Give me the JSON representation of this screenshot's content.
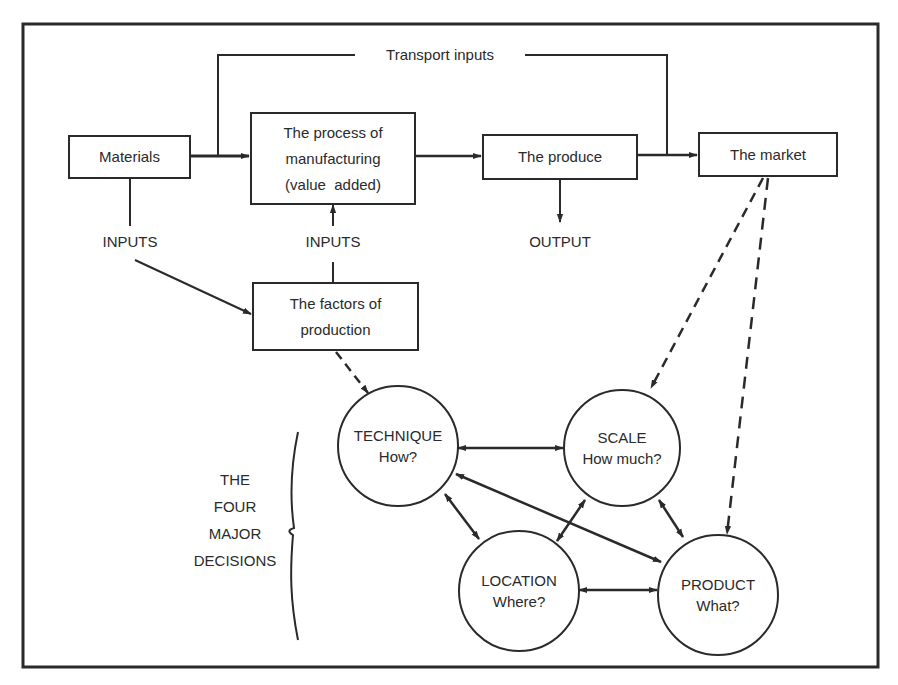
{
  "diagram": {
    "transport_label": "Transport inputs",
    "boxes": {
      "materials": {
        "lines": [
          "Materials"
        ]
      },
      "process": {
        "lines": [
          "The process of",
          "manufacturing",
          "(value  added)"
        ]
      },
      "produce": {
        "lines": [
          "The produce"
        ]
      },
      "market": {
        "lines": [
          "The market"
        ]
      },
      "factors": {
        "lines": [
          "The factors of",
          "production"
        ]
      }
    },
    "labels": {
      "inputs_left": "INPUTS",
      "inputs_center": "INPUTS",
      "output": "OUTPUT"
    },
    "decisions": {
      "group_label": [
        "THE",
        "FOUR",
        "MAJOR",
        "DECISIONS"
      ],
      "technique": {
        "title": "TECHNIQUE",
        "question": "How?"
      },
      "scale": {
        "title": "SCALE",
        "question": "How much?"
      },
      "location": {
        "title": "LOCATION",
        "question": "Where?"
      },
      "product": {
        "title": "PRODUCT",
        "question": "What?"
      }
    },
    "colors": {
      "ink": "#2a2a2a",
      "background": "#ffffff"
    }
  }
}
